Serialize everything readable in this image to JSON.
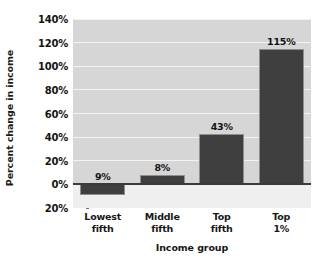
{
  "chart_data": {
    "type": "bar",
    "title": "",
    "xlabel": "Income group",
    "ylabel": "Percent change in income",
    "categories": [
      "Lowest\nfifth",
      "Middle\nfifth",
      "Top\nfifth",
      "Top\n1%"
    ],
    "category_lines": [
      [
        "Lowest",
        "fifth"
      ],
      [
        "Middle",
        "fifth"
      ],
      [
        "Top",
        "fifth"
      ],
      [
        "Top",
        "1%"
      ]
    ],
    "values": [
      -9,
      8,
      43,
      115
    ],
    "data_labels": [
      "9%",
      "8%",
      "43%",
      "115%"
    ],
    "ylim": [
      -20,
      140
    ],
    "ytick_values": [
      140,
      120,
      100,
      80,
      60,
      40,
      20,
      0,
      -20
    ],
    "ytick_labels": [
      "140%",
      "120%",
      "100%",
      "80%",
      "60%",
      "40%",
      "20%",
      "0%",
      "20%"
    ],
    "grid": true,
    "legend": false,
    "bar_color": "#3f3f3f",
    "plot_background": "#d6d6d6",
    "gridline_color": "#f4f4f4"
  }
}
